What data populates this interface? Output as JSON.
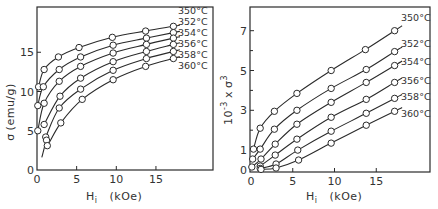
{
  "chart_data": [
    {
      "type": "line",
      "title": "",
      "xlabel": "H_i (kOe)",
      "ylabel": "σ (emu/g)",
      "xlim": [
        0,
        22
      ],
      "ylim": [
        0,
        20
      ],
      "xticks": [
        "0",
        "5",
        "10",
        "15"
      ],
      "yticks": [
        "0",
        "5",
        "10",
        "15"
      ],
      "grid": false,
      "legend_position": "inline-right",
      "series": [
        {
          "name": "350°C",
          "x": [
            0.2,
            0.9,
            2.7,
            5.3,
            9.5,
            13.7,
            17.2
          ],
          "y": [
            10.6,
            12.8,
            14.4,
            15.6,
            16.9,
            17.7,
            18.3
          ]
        },
        {
          "name": "352°C",
          "x": [
            0.1,
            0.8,
            2.8,
            5.5,
            9.6,
            13.8,
            17.2
          ],
          "y": [
            8.2,
            10.6,
            12.8,
            14.4,
            15.9,
            16.8,
            17.5
          ]
        },
        {
          "name": "354°C",
          "x": [
            0.1,
            0.9,
            2.8,
            5.5,
            9.6,
            13.8,
            17.2
          ],
          "y": [
            5.0,
            8.5,
            11.3,
            13.2,
            14.9,
            16.0,
            16.8
          ]
        },
        {
          "name": "356°C",
          "x": [
            0.9,
            2.9,
            5.5,
            9.6,
            13.8,
            17.2
          ],
          "y": [
            5.8,
            9.4,
            11.7,
            13.8,
            15.1,
            16.0
          ]
        },
        {
          "name": "358°C",
          "x": [
            1.1,
            2.8,
            5.5,
            9.6,
            13.8,
            17.2
          ],
          "y": [
            4.2,
            7.9,
            10.3,
            12.7,
            14.2,
            15.1
          ]
        },
        {
          "name": "360°C",
          "x": [
            1.2,
            1.3,
            3.0,
            5.7,
            9.6,
            13.7,
            17.2
          ],
          "y": [
            3.8,
            3.1,
            6.0,
            9.0,
            11.5,
            13.2,
            14.2
          ]
        }
      ]
    },
    {
      "type": "line",
      "title": "",
      "xlabel": "H_i (kOe)",
      "ylabel": "10⁻³ × σ³",
      "xlim": [
        0,
        22
      ],
      "ylim": [
        0,
        8
      ],
      "xticks": [
        "0",
        "5",
        "10",
        "15"
      ],
      "yticks": [
        "0",
        "1",
        "3",
        "5",
        "7"
      ],
      "grid": false,
      "legend_position": "inline-right",
      "series": [
        {
          "name": "350°C",
          "x": [
            0.3,
            1.1,
            2.8,
            5.5,
            9.6,
            13.7,
            17.2
          ],
          "y": [
            1.05,
            2.1,
            2.95,
            3.85,
            5.0,
            6.05,
            7.0
          ]
        },
        {
          "name": "352°C",
          "x": [
            0.2,
            1.1,
            2.8,
            5.5,
            9.6,
            13.8,
            17.2
          ],
          "y": [
            0.55,
            1.05,
            2.05,
            3.0,
            4.1,
            5.05,
            5.95
          ]
        },
        {
          "name": "354°C",
          "x": [
            0.1,
            1.2,
            2.9,
            5.5,
            9.6,
            13.8,
            17.2
          ],
          "y": [
            0.15,
            0.55,
            1.3,
            2.3,
            3.4,
            4.4,
            5.25
          ]
        },
        {
          "name": "356°C",
          "x": [
            1.1,
            2.9,
            5.5,
            9.6,
            13.8,
            17.2
          ],
          "y": [
            0.2,
            0.75,
            1.55,
            2.65,
            3.55,
            4.4
          ]
        },
        {
          "name": "358°C",
          "x": [
            1.1,
            3.0,
            5.6,
            9.6,
            13.8,
            17.2
          ],
          "y": [
            0.08,
            0.3,
            1.0,
            1.95,
            2.85,
            3.6
          ]
        },
        {
          "name": "360°C",
          "x": [
            1.2,
            3.0,
            5.7,
            9.6,
            13.8,
            17.2
          ],
          "y": [
            0.03,
            0.1,
            0.5,
            1.35,
            2.25,
            2.95
          ]
        }
      ]
    }
  ],
  "labels": {
    "left": {
      "ylabel_sigma": "σ",
      "ylabel_units": "(emu/g)",
      "xlabel_H": "H",
      "xlabel_sub": "i",
      "xlabel_units": "(kOe)"
    },
    "right": {
      "ylabel_prefix": "10",
      "ylabel_exp1": "-3",
      "ylabel_x": "x",
      "ylabel_sigma": "σ",
      "ylabel_exp2": "3",
      "xlabel_H": "H",
      "xlabel_sub": "i",
      "xlabel_units": "(kOe)"
    }
  }
}
